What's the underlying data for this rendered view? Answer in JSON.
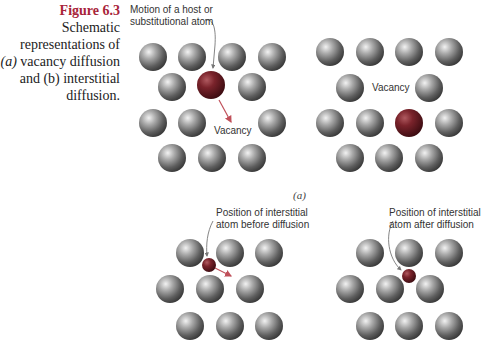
{
  "caption": {
    "figure_label": "Figure 6.3",
    "line1": "Schematic",
    "line2": "representations of",
    "line3_prefix": "(a)",
    "line3_rest": " vacancy diffusion",
    "line4_prefix": "and (b)",
    "line4_rest": " interstitial",
    "line5": "diffusion."
  },
  "panel_a": {
    "label": "(a)",
    "motion_label_line1": "Motion of a host or",
    "motion_label_line2": "substitutional atom",
    "vacancy_label_before": "Vacancy",
    "vacancy_label_after": "Vacancy"
  },
  "panel_b": {
    "before_label_line1": "Position of interstitial",
    "before_label_line2": "atom before diffusion",
    "after_label_line1": "Position of interstitial",
    "after_label_line2": "atom after diffusion"
  },
  "colors": {
    "host_atom": "#8a8a8a",
    "diffusing_atom": "#6e1e24",
    "arrow": "#c0505a",
    "figure_label": "#a8243a"
  }
}
